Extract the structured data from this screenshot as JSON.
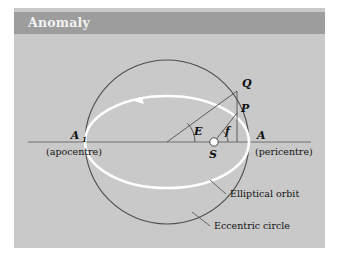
{
  "panel": {
    "background_color": "#c9c9c9",
    "page_background": "#ffffff"
  },
  "header": {
    "title": "Anomaly",
    "bar_color": "#9d9d9d",
    "title_color": "#f2f2f2"
  },
  "diagram": {
    "type": "orbital-anomaly-geometry",
    "eccentric_circle": {
      "label": "Eccentric circle",
      "color": "#4d4d4d",
      "center_x": 153,
      "center_y": 108,
      "radius": 82
    },
    "elliptical_orbit": {
      "label": "Elliptical orbit",
      "color": "#ffffff",
      "center_x": 153,
      "center_y": 108,
      "semi_major": 82,
      "semi_minor": 46,
      "direction": "counterclockwise"
    },
    "points": [
      {
        "name": "A1",
        "label": "A",
        "subscript": "1",
        "caption": "(apocentre)",
        "x": 71,
        "y": 108
      },
      {
        "name": "A",
        "label": "A",
        "subscript": "",
        "caption": "(pericentre)",
        "x": 235,
        "y": 108
      },
      {
        "name": "Q",
        "label": "Q",
        "caption": "",
        "x": 223,
        "y": 57
      },
      {
        "name": "P",
        "label": "P",
        "caption": "",
        "x": 223,
        "y": 79
      },
      {
        "name": "S",
        "label": "S",
        "caption": "",
        "x": 200,
        "y": 108,
        "marker": "white-filled-circle"
      }
    ],
    "angles": [
      {
        "name": "E",
        "label": "E",
        "vertex": "center",
        "description": "eccentric anomaly"
      },
      {
        "name": "f",
        "label": "f",
        "vertex": "S",
        "description": "true anomaly"
      }
    ],
    "callouts": [
      {
        "name": "elliptical-orbit-callout",
        "text": "Elliptical orbit"
      },
      {
        "name": "eccentric-circle-callout",
        "text": "Eccentric circle"
      }
    ]
  }
}
